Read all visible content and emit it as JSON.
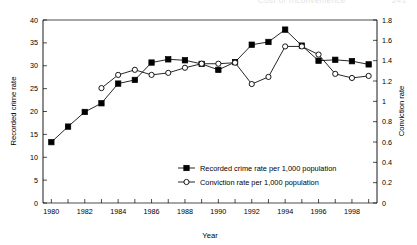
{
  "page_header": {
    "center_text": "Cost of Inconvenience",
    "right_text": "241",
    "note": "clipped at top edge, illegible"
  },
  "chart_data": {
    "type": "line",
    "title": "",
    "xlabel": "Year",
    "ylabel": "Recorded crime rate",
    "y2label": "Conviction rate",
    "grid": false,
    "legend_position": "inside-lower-center",
    "x": [
      1980,
      1981,
      1982,
      1983,
      1984,
      1985,
      1986,
      1987,
      1988,
      1989,
      1990,
      1991,
      1992,
      1993,
      1994,
      1995,
      1996,
      1997,
      1998,
      1999
    ],
    "xlim": [
      1979.5,
      1999.5
    ],
    "xticks": [
      1980,
      1981,
      1982,
      1983,
      1984,
      1985,
      1986,
      1987,
      1988,
      1989,
      1990,
      1991,
      1992,
      1993,
      1994,
      1995,
      1996,
      1997,
      1998,
      1999
    ],
    "xticklabels": [
      "1980",
      "",
      "1982",
      "",
      "1984",
      "",
      "1986",
      "",
      "1988",
      "",
      "1990",
      "",
      "1992",
      "",
      "1994",
      "",
      "1996",
      "",
      "1998",
      ""
    ],
    "ylim": [
      0,
      40
    ],
    "yticks": [
      0,
      5,
      10,
      15,
      20,
      25,
      30,
      35,
      40
    ],
    "yticklabels": [
      "0",
      "5",
      "10",
      "15",
      "20",
      "25",
      "30",
      "35",
      "40"
    ],
    "y2lim": [
      0,
      1.8
    ],
    "y2ticks": [
      0,
      0.2,
      0.4,
      0.6,
      0.8,
      1.0,
      1.2,
      1.4,
      1.6,
      1.8
    ],
    "y2ticklabels": [
      "0",
      "0.2",
      "0.4",
      "0.6",
      "0.8",
      "1",
      "1.2",
      "1.4",
      "1.6",
      "1.8"
    ],
    "series": [
      {
        "name": "Recorded crime rate per 1,000 population",
        "axis": "left",
        "marker": "filled-square",
        "color": "#000000",
        "x": [
          1980,
          1981,
          1982,
          1983,
          1984,
          1985,
          1986,
          1987,
          1988,
          1989,
          1990,
          1991,
          1992,
          1993,
          1994,
          1995,
          1996,
          1997,
          1998,
          1999
        ],
        "values": [
          13.3,
          16.7,
          19.9,
          21.8,
          26.1,
          26.9,
          30.7,
          31.4,
          31.2,
          30.4,
          29.1,
          30.8,
          34.6,
          35.2,
          37.9,
          34.4,
          31.1,
          31.3,
          31.0,
          30.3
        ]
      },
      {
        "name": "Conviction rate per 1,000 population",
        "axis": "right",
        "marker": "open-circle",
        "color": "#000000",
        "x": [
          1983,
          1984,
          1985,
          1986,
          1987,
          1988,
          1989,
          1990,
          1991,
          1992,
          1993,
          1994,
          1995,
          1996,
          1997,
          1998,
          1999
        ],
        "values": [
          1.13,
          1.26,
          1.31,
          1.26,
          1.28,
          1.33,
          1.37,
          1.37,
          1.38,
          1.17,
          1.24,
          1.54,
          1.54,
          1.46,
          1.27,
          1.23,
          1.25
        ]
      }
    ]
  },
  "legend": {
    "entries": [
      {
        "label": "Recorded crime rate per 1,000 population",
        "marker": "filled-square"
      },
      {
        "label": "Conviction rate per 1,000 population",
        "marker": "open-circle"
      }
    ]
  }
}
